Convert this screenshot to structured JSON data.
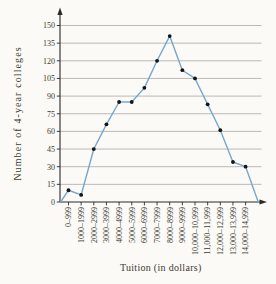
{
  "figure_label": "(e)",
  "colors": {
    "background": "#fbfaf7",
    "line": "#74a8cf",
    "point": "#141414",
    "grid": "#999693",
    "axis": "#2b2a26",
    "text": "#3e3a31"
  },
  "icons": {
    "y_axis_arrow": "up-arrow-icon",
    "x_axis_arrow": "right-arrow-icon"
  },
  "chart_data": {
    "type": "line",
    "subtype": "frequency-polygon",
    "title": "",
    "xlabel": "Tuition (in dollars)",
    "ylabel": "Number of 4-year colleges",
    "categories": [
      "0–999",
      "1000–1999",
      "2000–2999",
      "3000–3999",
      "4000–4999",
      "5000–5999",
      "6000–6999",
      "7000–7999",
      "8000–8999",
      "9000–9999",
      "10,000–10,999",
      "11,000–11,999",
      "12,000–12,999",
      "13,000–13,999",
      "14,000–14,999"
    ],
    "values": [
      10,
      6,
      45,
      66,
      85,
      85,
      97,
      120,
      141,
      112,
      105,
      83,
      61,
      34,
      30
    ],
    "ylim": [
      0,
      150
    ],
    "ytick_step": 15,
    "ytick_labels": [
      "0",
      "15",
      "30",
      "45",
      "60",
      "75",
      "90",
      "105",
      "120",
      "135",
      "150"
    ],
    "grid": "horizontal",
    "legend": "none",
    "polygon_closes_to_zero": true
  }
}
